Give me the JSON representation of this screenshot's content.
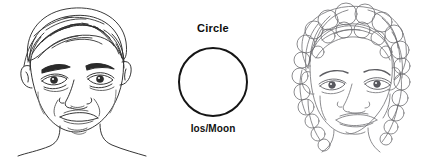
{
  "figure": {
    "background_color": "#ffffff",
    "ink_color_dark": "#1a1a1a",
    "ink_color_light": "#6e6e72",
    "panels": [
      {
        "id": "left-portrait",
        "kind": "line-drawing",
        "subject": "male face, short wavy hair, frontal view",
        "alt_text": "Pen and ink line drawing of a man's face with short wavy hair, shown from the front"
      },
      {
        "id": "center-shape",
        "kind": "geometric-shape",
        "shape": "circle",
        "title": "Circle",
        "caption": "Ios/Moon",
        "stroke_color": "#151515",
        "stroke_width": 2,
        "fill": "none"
      },
      {
        "id": "right-portrait",
        "kind": "line-drawing",
        "subject": "child face, curly hair, frontal view",
        "alt_text": "Pencil line drawing of a child's face framed by curly hair, shown from the front"
      }
    ]
  }
}
